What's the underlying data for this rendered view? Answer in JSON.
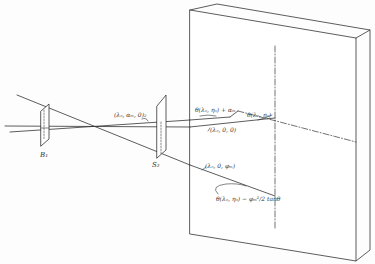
{
  "diagram": {
    "type": "optical-geometry-sketch",
    "colors": {
      "ink": "#333333",
      "background": "#fdfdfd"
    },
    "slits": [
      {
        "id": "slit-1",
        "label": "B₁"
      },
      {
        "id": "slit-2",
        "label": "S₂"
      }
    ],
    "labels": {
      "ray_upper_mid": "(λₒ, αₘ, 0)₂",
      "ray_center": "(λₒ, 0, 0)",
      "ray_lower": "(λₒ, 0, φₘ)",
      "point_upper_left": "θ(λₒ, ηₒ) + αₘ",
      "point_upper_right": "θ(λₒ, ηₒ)",
      "point_lower": "θ(λₒ, ηₒ) − φₘ²/2 tanθ"
    },
    "components": [
      "incident-rays",
      "slit-B1",
      "slit-S2",
      "detector-block",
      "optical-axis",
      "vertical-reference-axis"
    ]
  }
}
